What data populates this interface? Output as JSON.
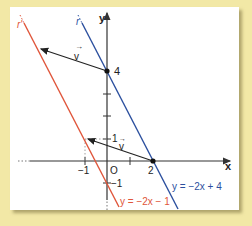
{
  "diagram": {
    "axes": {
      "x_label": "x",
      "y_label": "y",
      "origin_label": "O",
      "x_ticks": [
        {
          "value": -1,
          "label": "-1"
        },
        {
          "value": 1,
          "label": ""
        },
        {
          "value": 2,
          "label": "2"
        }
      ],
      "y_ticks": [
        {
          "value": 4,
          "label": "4"
        },
        {
          "value": 3,
          "label": ""
        },
        {
          "value": 2,
          "label": ""
        },
        {
          "value": 1,
          "label": "1"
        },
        {
          "value": -1,
          "label": "-1"
        }
      ]
    },
    "lines": [
      {
        "name": "r",
        "equation": "y = −2x + 4",
        "color": "#2b4f9e"
      },
      {
        "name": "r'",
        "equation": "y = −2x − 1",
        "color": "#e0553a"
      }
    ],
    "vectors": [
      {
        "label": "v",
        "from": [
          0,
          4
        ],
        "to": [
          -3,
          5
        ]
      },
      {
        "label": "v",
        "from": [
          2,
          0
        ],
        "to": [
          -1,
          1
        ]
      }
    ],
    "points": [
      {
        "x": 0,
        "y": 4,
        "label": "4"
      },
      {
        "x": 2,
        "y": 0,
        "label": "2"
      },
      {
        "x": -1,
        "y": 1,
        "label": ""
      }
    ],
    "colors": {
      "background": "#f2e8a6",
      "panel": "#ffffff",
      "line_r": "#2b4f9e",
      "line_r_prime": "#e0553a",
      "axes": "#333333"
    }
  },
  "labels": {
    "r": "r",
    "r_prime": "r'",
    "eq_r": "y = −2x + 4",
    "eq_r_prime": "y = −2x − 1",
    "v1": "v",
    "v2": "v",
    "y4": "4",
    "y1": "1",
    "ym1": "−1",
    "xm1": "−1",
    "x2": "2",
    "origin": "O",
    "xaxis": "x",
    "yaxis": "y"
  }
}
